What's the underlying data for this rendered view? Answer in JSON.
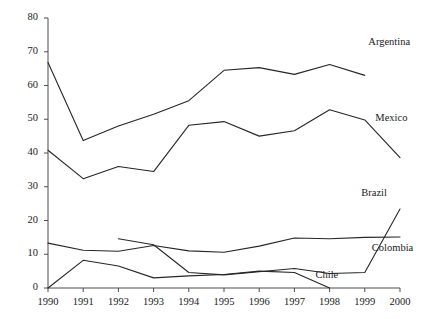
{
  "chart_data": {
    "type": "line",
    "title": "",
    "xlabel": "",
    "ylabel": "",
    "x": [
      1990,
      1991,
      1992,
      1993,
      1994,
      1995,
      1996,
      1997,
      1998,
      1999,
      2000
    ],
    "xlim": [
      1990,
      2000
    ],
    "ylim": [
      0,
      80
    ],
    "ytick_labels": [
      "0",
      "10",
      "20",
      "30",
      "40",
      "50",
      "60",
      "70",
      "80"
    ],
    "yticks": [
      0,
      10,
      20,
      30,
      40,
      50,
      60,
      70,
      80
    ],
    "xtick_labels": [
      "1990",
      "1991",
      "1992",
      "1993",
      "1994",
      "1995",
      "1996",
      "1997",
      "1998",
      "1999",
      "2000"
    ],
    "grid": false,
    "legend_position": "inline-right",
    "line_color": "#262626",
    "series": [
      {
        "name": "Argentina",
        "x": [
          1990,
          1991,
          1992,
          1993,
          1994,
          1995,
          1996,
          1997,
          1998,
          1999
        ],
        "values": [
          66.8,
          43.7,
          48.0,
          51.5,
          55.5,
          64.5,
          65.3,
          63.3,
          66.2,
          63.0
        ],
        "label_x": 1999.1,
        "label_y": 72.5
      },
      {
        "name": "Mexico",
        "x": [
          1990,
          1991,
          1992,
          1993,
          1994,
          1995,
          1996,
          1997,
          1998,
          1999,
          2000
        ],
        "values": [
          40.8,
          32.4,
          36.0,
          34.5,
          48.2,
          49.3,
          45.0,
          46.6,
          52.8,
          49.8,
          38.6
        ],
        "label_x": 1999.3,
        "label_y": 50.0
      },
      {
        "name": "Brazil",
        "x": [
          1992,
          1993,
          1994,
          1995,
          1996,
          1997,
          1998,
          1999,
          2000
        ],
        "values": [
          14.6,
          12.8,
          4.6,
          3.9,
          4.8,
          5.8,
          4.3,
          4.6,
          23.4
        ],
        "label_x": 1998.9,
        "label_y": 27.8
      },
      {
        "name": "Colombia",
        "x": [
          1990,
          1991,
          1992,
          1993,
          1994,
          1995,
          1996,
          1997,
          1998,
          1999,
          2000
        ],
        "values": [
          13.3,
          11.2,
          10.9,
          12.6,
          11.0,
          10.6,
          12.4,
          14.8,
          14.6,
          15.0,
          15.1
        ],
        "label_x": 1999.2,
        "label_y": 11.6
      },
      {
        "name": "Chile",
        "x": [
          1990,
          1991,
          1992,
          1993,
          1994,
          1995,
          1996,
          1997,
          1998
        ],
        "values": [
          0.0,
          8.2,
          6.5,
          3.0,
          3.6,
          4.0,
          5.0,
          4.6,
          0.0
        ],
        "label_x": 1997.6,
        "label_y": 3.6
      }
    ]
  }
}
